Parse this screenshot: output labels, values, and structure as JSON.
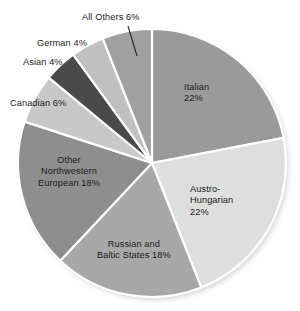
{
  "chart_data": {
    "type": "pie",
    "title": "",
    "subtitle": "",
    "xlabel": "",
    "ylabel": "",
    "legend_position": "none",
    "grid": false,
    "value_unit": "%",
    "start_angle_deg": 0,
    "direction": "clockwise",
    "categories": [
      "Italian",
      "Austro-Hungarian",
      "Russian and Baltic States",
      "Other Northwestern European",
      "Canadian",
      "Asian",
      "German",
      "All Others"
    ],
    "values": [
      22,
      22,
      18,
      18,
      6,
      4,
      4,
      6
    ],
    "slices": [
      {
        "name": "Italian",
        "value": 22,
        "label_lines": [
          "Italian",
          "22%"
        ],
        "label_text": "Italian 22%",
        "color": "#9a9a9a",
        "label_placement": "inside"
      },
      {
        "name": "Austro-Hungarian",
        "value": 22,
        "label_lines": [
          "Austro-",
          "Hungarian",
          "22%"
        ],
        "label_text": "Austro-Hungarian 22%",
        "color": "#dedede",
        "label_placement": "inside"
      },
      {
        "name": "Russian and Baltic States",
        "value": 18,
        "label_lines": [
          "Russian and",
          "Baltic States 18%"
        ],
        "label_text": "Russian and Baltic States 18%",
        "color": "#a8a8a8",
        "label_placement": "inside"
      },
      {
        "name": "Other Northwestern European",
        "value": 18,
        "label_lines": [
          "Other",
          "Northwestern",
          "European 18%"
        ],
        "label_text": "Other Northwestern European 18%",
        "color": "#8e8e8e",
        "label_placement": "inside"
      },
      {
        "name": "Canadian",
        "value": 6,
        "label_lines": [
          "Canadian 6%"
        ],
        "label_text": "Canadian 6%",
        "color": "#c8c8c8",
        "label_placement": "outside"
      },
      {
        "name": "Asian",
        "value": 4,
        "label_lines": [
          "Asian 4%"
        ],
        "label_text": "Asian 4%",
        "color": "#4a4a4a",
        "label_placement": "outside"
      },
      {
        "name": "German",
        "value": 4,
        "label_lines": [
          "German 4%"
        ],
        "label_text": "German 4%",
        "color": "#c0c0c0",
        "label_placement": "outside"
      },
      {
        "name": "All Others",
        "value": 6,
        "label_lines": [
          "All Others 6%"
        ],
        "label_text": "All Others 6%",
        "color": "#a0a0a0",
        "label_placement": "outside-leader"
      }
    ],
    "total": 100,
    "separator_color": "#ffffff",
    "background_color": "#ffffff",
    "text_color": "#1b1b1b"
  },
  "labels": {
    "italian": {
      "l1": "Italian",
      "l2": "22%"
    },
    "austro": {
      "l1": "Austro-",
      "l2": "Hungarian",
      "l3": "22%"
    },
    "russian": {
      "l1": "Russian and",
      "l2": "Baltic States 18%"
    },
    "other_nw": {
      "l1": "Other",
      "l2": "Northwestern",
      "l3": "European 18%"
    },
    "canadian": {
      "l1": "Canadian 6%"
    },
    "asian": {
      "l1": "Asian 4%"
    },
    "german": {
      "l1": "German 4%"
    },
    "all_others": {
      "l1": "All Others 6%"
    }
  }
}
